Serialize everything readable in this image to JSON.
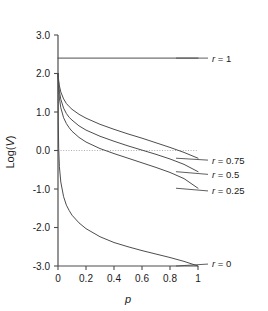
{
  "chart_data": {
    "type": "line",
    "title": "",
    "subtitle": "",
    "xlabel": "p",
    "ylabel": "Log(V)",
    "xlim": [
      0,
      1
    ],
    "ylim": [
      -3.0,
      3.0
    ],
    "xticks": [
      0,
      0.2,
      0.4,
      0.6,
      0.8,
      1
    ],
    "xticklabels": [
      "0",
      "0.2",
      "0.4",
      "0.6",
      "0.8",
      "1"
    ],
    "yticks": [
      -3.0,
      -2.0,
      -1.0,
      0.0,
      1.0,
      2.0,
      3.0
    ],
    "yticklabels": [
      "-3.0",
      "-2.0",
      "-1.0",
      "0.0",
      "1.0",
      "2.0",
      "3.0"
    ],
    "grid": false,
    "reference_lines": [
      {
        "name": "zero-line",
        "axis": "y",
        "value": 0.0,
        "style": "dotted",
        "color": "#999999"
      }
    ],
    "legend_position": "right-inline",
    "line_color": "#4d4d4d",
    "series": [
      {
        "name": "r = 1",
        "label": "r = 1",
        "r": 1,
        "label_y": 2.4,
        "x": [
          0,
          0.05,
          0.1,
          0.2,
          0.3,
          0.4,
          0.5,
          0.6,
          0.7,
          0.8,
          0.9,
          1.0
        ],
        "values": [
          2.4,
          2.4,
          2.4,
          2.4,
          2.4,
          2.4,
          2.4,
          2.4,
          2.4,
          2.4,
          2.4,
          2.4
        ]
      },
      {
        "name": "r = 0.75",
        "label": "r = 0.75",
        "r": 0.75,
        "label_y": -0.25,
        "x": [
          0,
          0.005,
          0.01,
          0.02,
          0.04,
          0.06,
          0.08,
          0.1,
          0.15,
          0.2,
          0.3,
          0.4,
          0.5,
          0.6,
          0.7,
          0.8,
          0.9,
          1.0
        ],
        "values": [
          2.0,
          1.82,
          1.68,
          1.52,
          1.34,
          1.22,
          1.14,
          1.07,
          0.94,
          0.84,
          0.68,
          0.55,
          0.43,
          0.32,
          0.2,
          0.08,
          -0.05,
          -0.2
        ]
      },
      {
        "name": "r = 0.5",
        "label": "r = 0.5",
        "r": 0.5,
        "label_y": -0.62,
        "x": [
          0,
          0.005,
          0.01,
          0.02,
          0.04,
          0.06,
          0.08,
          0.1,
          0.15,
          0.2,
          0.3,
          0.4,
          0.5,
          0.6,
          0.7,
          0.8,
          0.9,
          1.0
        ],
        "values": [
          2.0,
          1.72,
          1.54,
          1.33,
          1.1,
          0.96,
          0.86,
          0.79,
          0.64,
          0.53,
          0.37,
          0.24,
          0.12,
          0.01,
          -0.1,
          -0.22,
          -0.36,
          -0.55
        ]
      },
      {
        "name": "r = 0.25",
        "label": "r = 0.25",
        "r": 0.25,
        "label_y": -1.05,
        "x": [
          0,
          0.005,
          0.01,
          0.02,
          0.04,
          0.06,
          0.08,
          0.1,
          0.15,
          0.2,
          0.3,
          0.4,
          0.5,
          0.6,
          0.7,
          0.8,
          0.9,
          1.0
        ],
        "values": [
          2.0,
          1.58,
          1.36,
          1.11,
          0.85,
          0.7,
          0.59,
          0.5,
          0.34,
          0.22,
          0.05,
          -0.08,
          -0.2,
          -0.32,
          -0.44,
          -0.57,
          -0.73,
          -0.98
        ]
      },
      {
        "name": "r = 0",
        "label": "r = 0",
        "r": 0,
        "label_y": -2.95,
        "x": [
          0,
          0.002,
          0.005,
          0.01,
          0.02,
          0.04,
          0.06,
          0.08,
          0.1,
          0.15,
          0.2,
          0.3,
          0.4,
          0.5,
          0.6,
          0.7,
          0.8,
          0.9,
          0.95,
          1.0
        ],
        "values": [
          2.0,
          0.75,
          0.05,
          -0.42,
          -0.82,
          -1.2,
          -1.42,
          -1.56,
          -1.68,
          -1.88,
          -2.03,
          -2.24,
          -2.39,
          -2.5,
          -2.6,
          -2.69,
          -2.78,
          -2.88,
          -2.94,
          -3.0
        ]
      }
    ]
  }
}
